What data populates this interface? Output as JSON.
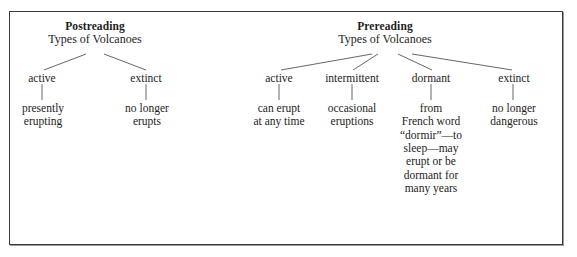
{
  "figure": {
    "kind": "concept-tree-diagram",
    "background_color": "#ffffff",
    "text_color": "#1d1d1d",
    "frame_color": "#3a3a3a"
  },
  "trees": [
    {
      "id": "postreading",
      "heading": "Postreading",
      "root": "Types of Volcanoes",
      "children": [
        {
          "label": "active",
          "description": "presently\nerupting"
        },
        {
          "label": "extinct",
          "description": "no longer\nerupts"
        }
      ]
    },
    {
      "id": "prereading",
      "heading": "Prereading",
      "root": "Types of Volcanoes",
      "children": [
        {
          "label": "active",
          "description": "can erupt\nat any time"
        },
        {
          "label": "intermittent",
          "description": "occasional\neruptions"
        },
        {
          "label": "dormant",
          "description": "from\nFrench word\n“dormir”—to\nsleep—may\nerupt or be\ndormant for\nmany years"
        },
        {
          "label": "extinct",
          "description": "no longer\ndangerous"
        }
      ]
    }
  ]
}
